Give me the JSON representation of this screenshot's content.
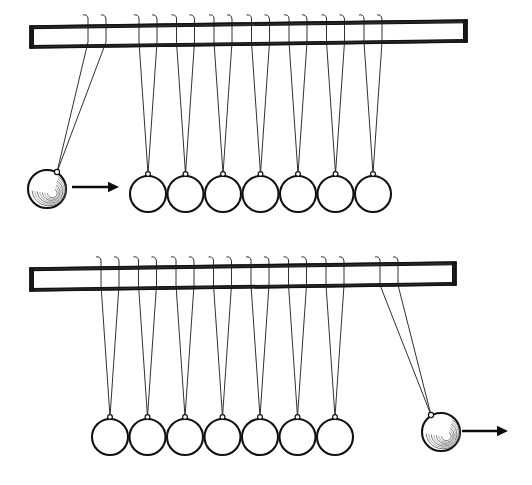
{
  "figure": {
    "background_color": "#ffffff",
    "ink_color": "#111111",
    "width": 532,
    "height": 485,
    "panel_count": 2
  },
  "panels": [
    {
      "id": "top",
      "label": "Top panel: one ball raised on the left, about to strike",
      "bar": {
        "name": "support-bar",
        "x_left": 30,
        "x_right": 467,
        "y_top": 20,
        "y_bottom": 42,
        "skew": 6,
        "color": "#2a2a2a"
      },
      "swinging_ball": {
        "side": "left",
        "cx": 47,
        "cy": 189,
        "r": 19,
        "pivot_x_a": 88,
        "pivot_x_b": 106,
        "eyelet_x": 57,
        "eyelet_y": 172,
        "has_motion_swirl": true
      },
      "arrow": {
        "direction": "right",
        "x_start": 72,
        "x_end": 119,
        "y": 187
      },
      "resting_balls": {
        "count": 7,
        "first_cx": 148,
        "spacing": 37.5,
        "cy": 194,
        "r": 18,
        "eyelet_y": 174
      }
    },
    {
      "id": "bottom",
      "label": "Bottom panel: ball ejected on the right after impact",
      "bar": {
        "name": "support-bar",
        "x_left": 30,
        "x_right": 456,
        "y_top": 262,
        "y_bottom": 285,
        "skew": 6,
        "color": "#2a2a2a"
      },
      "swinging_ball": {
        "side": "right",
        "cx": 441,
        "cy": 432,
        "r": 19,
        "pivot_x_a": 380,
        "pivot_x_b": 398,
        "eyelet_x": 431,
        "eyelet_y": 415,
        "has_motion_swirl": true
      },
      "arrow": {
        "direction": "right",
        "x_start": 462,
        "x_end": 508,
        "y": 431
      },
      "resting_balls": {
        "count": 7,
        "first_cx": 110,
        "spacing": 37.5,
        "cy": 437,
        "r": 18,
        "eyelet_y": 417
      }
    }
  ],
  "elements": {
    "ball_name": "pendulum-ball",
    "string_name": "suspension-string",
    "eyelet_name": "string-eyelet",
    "arrow_name": "motion-arrow",
    "bar_name": "support-bar"
  }
}
